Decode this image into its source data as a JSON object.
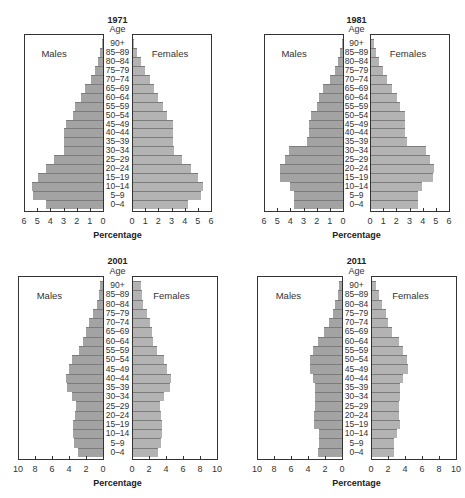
{
  "chart_data": [
    {
      "type": "bar",
      "subtype": "population-pyramid",
      "title": "1971",
      "age_header": "Age",
      "categories": [
        "90+",
        "85–89",
        "80–84",
        "75–79",
        "70–74",
        "65–69",
        "60–64",
        "55–59",
        "50–54",
        "45–49",
        "40–44",
        "35–39",
        "30–34",
        "25–29",
        "20–24",
        "15–19",
        "10–14",
        "5–9",
        "0–4"
      ],
      "series": [
        {
          "name": "Males",
          "values": [
            0.1,
            0.2,
            0.4,
            0.6,
            0.9,
            1.4,
            1.7,
            2.1,
            2.3,
            2.8,
            3.0,
            3.0,
            3.0,
            3.7,
            4.3,
            4.9,
            5.4,
            5.3,
            4.3
          ]
        },
        {
          "name": "Females",
          "values": [
            0.1,
            0.3,
            0.6,
            0.9,
            1.3,
            1.6,
            1.9,
            2.3,
            2.6,
            3.0,
            3.0,
            3.0,
            3.1,
            3.7,
            4.4,
            4.9,
            5.3,
            5.2,
            4.2
          ]
        }
      ],
      "xlabel": "Percentage",
      "xticks": [
        6,
        5,
        4,
        3,
        2,
        1,
        0,
        0,
        1,
        2,
        3,
        4,
        5,
        6
      ],
      "xlim": [
        0,
        6
      ],
      "legend": [
        "Males",
        "Females"
      ],
      "grid": false
    },
    {
      "type": "bar",
      "subtype": "population-pyramid",
      "title": "1981",
      "age_header": "Age",
      "categories": [
        "90+",
        "85–89",
        "80–84",
        "75–79",
        "70–74",
        "65–69",
        "60–64",
        "55–59",
        "50–54",
        "45–49",
        "40–44",
        "35–39",
        "30–34",
        "25–29",
        "20–24",
        "15–19",
        "10–14",
        "5–9",
        "0–4"
      ],
      "series": [
        {
          "name": "Males",
          "values": [
            0.1,
            0.2,
            0.4,
            0.6,
            1.0,
            1.5,
            1.8,
            2.0,
            2.4,
            2.6,
            2.6,
            2.7,
            4.1,
            4.4,
            4.8,
            4.8,
            4.0,
            3.7,
            3.7
          ]
        },
        {
          "name": "Females",
          "values": [
            0.2,
            0.4,
            0.6,
            0.9,
            1.2,
            1.6,
            2.0,
            2.2,
            2.6,
            2.6,
            2.6,
            2.7,
            4.2,
            4.5,
            4.8,
            4.7,
            3.9,
            3.6,
            3.6
          ]
        }
      ],
      "xlabel": "Percentage",
      "xticks": [
        6,
        5,
        4,
        3,
        2,
        1,
        0,
        0,
        1,
        2,
        3,
        4,
        5,
        6
      ],
      "xlim": [
        0,
        6
      ],
      "legend": [
        "Males",
        "Females"
      ],
      "grid": false
    },
    {
      "type": "bar",
      "subtype": "population-pyramid",
      "title": "2001",
      "age_header": "Age",
      "categories": [
        "90+",
        "85–89",
        "80–84",
        "75–79",
        "70–74",
        "65–69",
        "60–64",
        "55–59",
        "50–54",
        "45–49",
        "40–44",
        "35–39",
        "30–34",
        "25–29",
        "20–24",
        "15–19",
        "10–14",
        "5–9",
        "0–4"
      ],
      "series": [
        {
          "name": "Males",
          "values": [
            0.3,
            0.5,
            0.7,
            1.2,
            1.6,
            2.0,
            2.3,
            2.8,
            3.6,
            4.0,
            4.3,
            4.2,
            3.6,
            3.2,
            3.3,
            3.5,
            3.5,
            3.4,
            3.0
          ]
        },
        {
          "name": "Females",
          "values": [
            0.9,
            1.0,
            1.2,
            1.7,
            2.0,
            2.2,
            2.3,
            2.8,
            3.6,
            4.0,
            4.5,
            4.4,
            3.7,
            3.2,
            3.3,
            3.4,
            3.4,
            3.3,
            2.9
          ]
        }
      ],
      "xlabel": "Percentage",
      "xticks": [
        10,
        8,
        6,
        4,
        2,
        0,
        0,
        2,
        4,
        6,
        8,
        10
      ],
      "xlim": [
        0,
        10
      ],
      "legend": [
        "Males",
        "Females"
      ],
      "grid": false
    },
    {
      "type": "bar",
      "subtype": "population-pyramid",
      "title": "2011",
      "age_header": "Age",
      "categories": [
        "90+",
        "85–89",
        "80–84",
        "75–79",
        "70–74",
        "65–69",
        "60–64",
        "55–59",
        "50–54",
        "45–49",
        "40–44",
        "35–39",
        "30–34",
        "25–29",
        "20–24",
        "15–19",
        "10–14",
        "5–9",
        "0–4"
      ],
      "series": [
        {
          "name": "Males",
          "values": [
            0.3,
            0.5,
            0.8,
            1.1,
            1.5,
            2.1,
            2.8,
            3.4,
            3.8,
            3.8,
            3.4,
            3.2,
            3.2,
            3.2,
            3.3,
            3.3,
            2.7,
            2.7,
            2.8
          ]
        },
        {
          "name": "Females",
          "values": [
            0.5,
            0.8,
            1.2,
            1.6,
            1.9,
            2.4,
            3.2,
            3.7,
            4.1,
            4.2,
            3.6,
            3.3,
            3.3,
            3.2,
            3.2,
            3.3,
            2.9,
            2.6,
            2.6
          ]
        }
      ],
      "xlabel": "Percentage",
      "xticks": [
        10,
        8,
        6,
        4,
        2,
        0,
        0,
        2,
        4,
        6,
        8,
        10
      ],
      "xlim": [
        0,
        10
      ],
      "legend": [
        "Males",
        "Females"
      ],
      "grid": false
    }
  ],
  "layout": {
    "panels": [
      {
        "mL": 24,
        "mR": 103,
        "fL": 132,
        "fR": 211,
        "top": 34,
        "bottom": 212,
        "yearY": 15,
        "ageY": 24,
        "max": 6
      },
      {
        "mL": 264,
        "mR": 343,
        "fL": 370,
        "fR": 449,
        "top": 34,
        "bottom": 212,
        "yearY": 15,
        "ageY": 24,
        "max": 6
      },
      {
        "mL": 18,
        "mR": 103,
        "fL": 132,
        "fR": 217,
        "top": 276,
        "bottom": 460,
        "yearY": 256,
        "ageY": 266,
        "max": 10
      },
      {
        "mL": 257,
        "mR": 342,
        "fL": 371,
        "fR": 456,
        "top": 276,
        "bottom": 460,
        "yearY": 256,
        "ageY": 266,
        "max": 10
      }
    ]
  }
}
